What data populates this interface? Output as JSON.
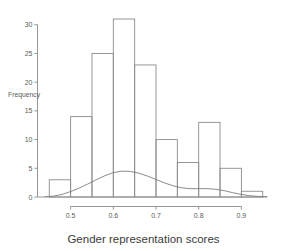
{
  "chart_data": {
    "type": "bar",
    "title": "",
    "subtitle": "",
    "xlabel": "Gender representation scores",
    "ylabel": "Frequency",
    "categories": [
      "0.45-0.50",
      "0.50-0.55",
      "0.55-0.60",
      "0.60-0.65",
      "0.65-0.70",
      "0.70-0.75",
      "0.75-0.80",
      "0.80-0.85",
      "0.85-0.90",
      "0.90-0.95"
    ],
    "bin_edges": [
      0.45,
      0.5,
      0.55,
      0.6,
      0.65,
      0.7,
      0.75,
      0.8,
      0.85,
      0.9,
      0.95
    ],
    "values": [
      3,
      14,
      25,
      31,
      23,
      10,
      6,
      13,
      5,
      1
    ],
    "xlim": [
      0.44,
      0.96
    ],
    "ylim": [
      0,
      31
    ],
    "xticks": [
      0.5,
      0.6,
      0.7,
      0.8,
      0.9
    ],
    "xticklabels": [
      "0.5",
      "0.6",
      "0.7",
      "0.8",
      "0.9"
    ],
    "yticks": [
      0,
      5,
      10,
      15,
      20,
      25,
      30
    ],
    "yticklabels": [
      "0",
      "5",
      "10",
      "15",
      "20",
      "25",
      "30"
    ],
    "grid": false,
    "legend": "none",
    "overlay": {
      "type": "line",
      "name": "density curve",
      "x": [
        0.44,
        0.46,
        0.48,
        0.5,
        0.52,
        0.54,
        0.56,
        0.58,
        0.6,
        0.62,
        0.64,
        0.66,
        0.68,
        0.7,
        0.72,
        0.74,
        0.76,
        0.78,
        0.8,
        0.82,
        0.84,
        0.86,
        0.88,
        0.9,
        0.92,
        0.94,
        0.96
      ],
      "y": [
        0.05,
        0.15,
        0.45,
        0.95,
        1.55,
        2.25,
        3.0,
        3.7,
        4.25,
        4.5,
        4.45,
        4.15,
        3.65,
        3.05,
        2.45,
        1.95,
        1.6,
        1.45,
        1.45,
        1.45,
        1.35,
        1.1,
        0.75,
        0.45,
        0.22,
        0.1,
        0.05
      ]
    }
  },
  "axes": {
    "x_title": "Gender representation scores",
    "y_title": "Frequency"
  },
  "colors": {
    "bar_stroke": "#8c8c8c",
    "bar_fill": "none",
    "axis": "#8a8a8a",
    "density": "#7d7d7d",
    "text": "#4a4a4a",
    "background": "#ffffff"
  }
}
